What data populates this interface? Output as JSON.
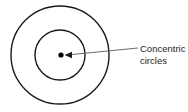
{
  "diagram": {
    "background_color": "#ffffff",
    "stroke_color": "#1a1a1a",
    "leader_color": "#6d6e71",
    "text_color": "#231f20",
    "annotation": {
      "line1": "Concentric",
      "line2": "circles"
    },
    "shapes": {
      "outer_circle": {
        "name": "outer-circle",
        "cx": 60,
        "cy": 55,
        "r": 49,
        "stroke_width": 1.4
      },
      "inner_circle": {
        "name": "inner-circle",
        "cx": 60,
        "cy": 55,
        "r": 25,
        "stroke_width": 1.4
      },
      "center_point": {
        "name": "center-point",
        "cx": 61,
        "cy": 55,
        "r": 2.6
      },
      "leader_line": {
        "name": "leader-line",
        "x1": 138,
        "y1": 48,
        "x2": 67,
        "y2": 55,
        "stroke_width": 1.1
      },
      "arrow_head": {
        "name": "arrow-head",
        "points": "65,55 72,52 72,58"
      }
    }
  }
}
